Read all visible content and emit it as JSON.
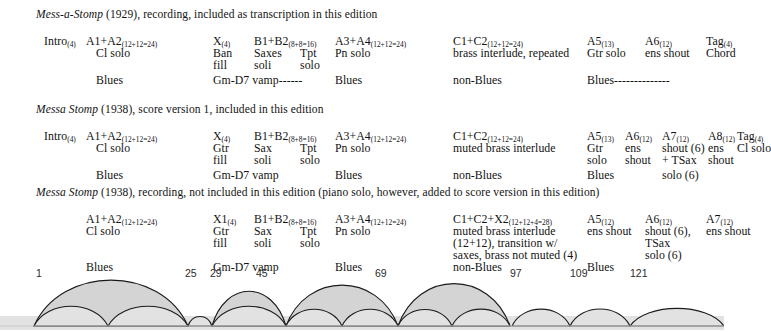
{
  "document": {
    "title": "Mess-a-Stomp / Messa Stomp form chart"
  },
  "blocks": [
    {
      "id": "block-1929-recording",
      "header": {
        "italic": "Mess-a-Stomp",
        "rest": " (1929), recording, included as transcription in this edition"
      },
      "rows": [
        {
          "label": "Intro",
          "sub": "(4)",
          "x": 8,
          "y": 16
        },
        {
          "label": "A1+A2",
          "sub": "(12+12=24)",
          "x": 50,
          "y": 16
        },
        {
          "label": "X",
          "sub": "(4)",
          "x": 177,
          "y": 16
        },
        {
          "label": "B1+B2",
          "sub": "(8+8=16)",
          "x": 218,
          "y": 16
        },
        {
          "label": "A3+A4",
          "sub": "(12+12=24)",
          "x": 299,
          "y": 16
        },
        {
          "label": "C1+C2",
          "sub": "(12+12=24)",
          "x": 417,
          "y": 16
        },
        {
          "label": "A5",
          "sub": "(13)",
          "x": 551,
          "y": 16
        },
        {
          "label": "A6",
          "sub": "(12)",
          "x": 609,
          "y": 16
        },
        {
          "label": "Tag",
          "sub": "(4)",
          "x": 670,
          "y": 16
        },
        {
          "label": "Cl solo",
          "sub": "",
          "x": 60,
          "y": 28
        },
        {
          "label": "Ban",
          "sub": "",
          "x": 177,
          "y": 28
        },
        {
          "label": "Saxes",
          "sub": "",
          "x": 218,
          "y": 28
        },
        {
          "label": "Tpt",
          "sub": "",
          "x": 264,
          "y": 28
        },
        {
          "label": "Pn solo",
          "sub": "",
          "x": 299,
          "y": 28
        },
        {
          "label": "brass interlude, repeated",
          "sub": "",
          "x": 417,
          "y": 28
        },
        {
          "label": "Gtr solo",
          "sub": "",
          "x": 551,
          "y": 28
        },
        {
          "label": "ens shout",
          "sub": "",
          "x": 609,
          "y": 28
        },
        {
          "label": "Chord",
          "sub": "",
          "x": 670,
          "y": 28
        },
        {
          "label": "fill",
          "sub": "",
          "x": 177,
          "y": 40
        },
        {
          "label": "soli",
          "sub": "",
          "x": 218,
          "y": 40
        },
        {
          "label": "solo",
          "sub": "",
          "x": 264,
          "y": 40
        },
        {
          "label": "Blues",
          "sub": "",
          "x": 60,
          "y": 55
        },
        {
          "label": "Gm-D7 vamp------",
          "sub": "",
          "x": 177,
          "y": 55
        },
        {
          "label": "Blues",
          "sub": "",
          "x": 299,
          "y": 55
        },
        {
          "label": "non-Blues",
          "sub": "",
          "x": 417,
          "y": 55
        },
        {
          "label": "Blues--------------",
          "sub": "",
          "x": 551,
          "y": 55
        }
      ]
    },
    {
      "id": "block-1938-score",
      "header": {
        "italic": "Messa Stomp",
        "rest": " (1938), score version 1, included in this edition"
      },
      "rows": [
        {
          "label": "Intro",
          "sub": "(4)",
          "x": 8,
          "y": 16
        },
        {
          "label": "A1+A2",
          "sub": "(12+12=24)",
          "x": 50,
          "y": 16
        },
        {
          "label": "X",
          "sub": "(4)",
          "x": 177,
          "y": 16
        },
        {
          "label": "B1+B2",
          "sub": "(8+8=16)",
          "x": 218,
          "y": 16
        },
        {
          "label": "A3+A4",
          "sub": "(12+12=24)",
          "x": 299,
          "y": 16
        },
        {
          "label": "C1+C2",
          "sub": "(12+12=24)",
          "x": 417,
          "y": 16
        },
        {
          "label": "A5",
          "sub": "(13)",
          "x": 551,
          "y": 16
        },
        {
          "label": "A6",
          "sub": "(12)",
          "x": 589,
          "y": 16
        },
        {
          "label": "A7",
          "sub": "(12)",
          "x": 626,
          "y": 16
        },
        {
          "label": "A8",
          "sub": "(12)",
          "x": 672,
          "y": 16
        },
        {
          "label": "Tag",
          "sub": "(4)",
          "x": 701,
          "y": 16
        },
        {
          "label": "Cl solo",
          "sub": "",
          "x": 60,
          "y": 28
        },
        {
          "label": "Gtr",
          "sub": "",
          "x": 177,
          "y": 28
        },
        {
          "label": "Sax",
          "sub": "",
          "x": 218,
          "y": 28
        },
        {
          "label": "Tpt",
          "sub": "",
          "x": 264,
          "y": 28
        },
        {
          "label": "Pn solo",
          "sub": "",
          "x": 299,
          "y": 28
        },
        {
          "label": "muted brass interlude",
          "sub": "",
          "x": 417,
          "y": 28
        },
        {
          "label": "Gtr",
          "sub": "",
          "x": 551,
          "y": 28
        },
        {
          "label": "ens",
          "sub": "",
          "x": 589,
          "y": 28
        },
        {
          "label": "shout (6)",
          "sub": "",
          "x": 626,
          "y": 28
        },
        {
          "label": "ens",
          "sub": "",
          "x": 672,
          "y": 28
        },
        {
          "label": "Cl solo",
          "sub": "",
          "x": 701,
          "y": 28
        },
        {
          "label": "fill",
          "sub": "",
          "x": 177,
          "y": 40
        },
        {
          "label": "soli",
          "sub": "",
          "x": 218,
          "y": 40
        },
        {
          "label": "solo",
          "sub": "",
          "x": 264,
          "y": 40
        },
        {
          "label": "solo",
          "sub": "",
          "x": 551,
          "y": 40
        },
        {
          "label": "shout",
          "sub": "",
          "x": 589,
          "y": 40
        },
        {
          "label": "+ TSax",
          "sub": "",
          "x": 626,
          "y": 40
        },
        {
          "label": "shout",
          "sub": "",
          "x": 672,
          "y": 40
        },
        {
          "label": "Blues",
          "sub": "",
          "x": 60,
          "y": 55
        },
        {
          "label": "Gm-D7 vamp",
          "sub": "",
          "x": 177,
          "y": 55
        },
        {
          "label": "Blues",
          "sub": "",
          "x": 299,
          "y": 55
        },
        {
          "label": "non-Blues",
          "sub": "",
          "x": 417,
          "y": 55
        },
        {
          "label": "Blues",
          "sub": "",
          "x": 551,
          "y": 55
        },
        {
          "label": "solo (6)",
          "sub": "",
          "x": 626,
          "y": 55
        }
      ]
    },
    {
      "id": "block-1938-recording",
      "header": {
        "italic": "Messa Stomp",
        "rest": " (1938), recording, not included in this edition (piano solo, however, added to score version in this edition)"
      },
      "rows": [
        {
          "label": "A1+A2",
          "sub": "(12+12=24)",
          "x": 50,
          "y": 16
        },
        {
          "label": "X1",
          "sub": "(4)",
          "x": 177,
          "y": 16
        },
        {
          "label": "B1+B2",
          "sub": "(8+8=16)",
          "x": 218,
          "y": 16
        },
        {
          "label": "A3+A4",
          "sub": "(12+12=24)",
          "x": 299,
          "y": 16
        },
        {
          "label": "C1+C2+X2",
          "sub": "(12+12+4=28)",
          "x": 417,
          "y": 16
        },
        {
          "label": "A5",
          "sub": "(12)",
          "x": 551,
          "y": 16
        },
        {
          "label": "A6",
          "sub": "(12)",
          "x": 609,
          "y": 16
        },
        {
          "label": "A7",
          "sub": "(12)",
          "x": 670,
          "y": 16
        },
        {
          "label": "Cl solo",
          "sub": "",
          "x": 50,
          "y": 28
        },
        {
          "label": "Gtr",
          "sub": "",
          "x": 177,
          "y": 28
        },
        {
          "label": "Sax",
          "sub": "",
          "x": 218,
          "y": 28
        },
        {
          "label": "Tpt",
          "sub": "",
          "x": 264,
          "y": 28
        },
        {
          "label": "Pn solo",
          "sub": "",
          "x": 299,
          "y": 28
        },
        {
          "label": "muted brass interlude",
          "sub": "",
          "x": 417,
          "y": 28
        },
        {
          "label": "ens shout",
          "sub": "",
          "x": 551,
          "y": 28
        },
        {
          "label": "shout (6),",
          "sub": "",
          "x": 609,
          "y": 28
        },
        {
          "label": "ens shout",
          "sub": "",
          "x": 670,
          "y": 28
        },
        {
          "label": "fill",
          "sub": "",
          "x": 177,
          "y": 40
        },
        {
          "label": "soli",
          "sub": "",
          "x": 218,
          "y": 40
        },
        {
          "label": "solo",
          "sub": "",
          "x": 264,
          "y": 40
        },
        {
          "label": "(12+12), transition w/",
          "sub": "",
          "x": 417,
          "y": 40
        },
        {
          "label": "TSax",
          "sub": "",
          "x": 609,
          "y": 40
        },
        {
          "label": "saxes, brass not muted (4)",
          "sub": "",
          "x": 417,
          "y": 52
        },
        {
          "label": "solo (6)",
          "sub": "",
          "x": 609,
          "y": 52
        },
        {
          "label": "Blues",
          "sub": "",
          "x": 50,
          "y": 64
        },
        {
          "label": "Gm-D7 vamp",
          "sub": "",
          "x": 177,
          "y": 64
        },
        {
          "label": "Blues",
          "sub": "",
          "x": 299,
          "y": 64
        },
        {
          "label": "non-Blues",
          "sub": "",
          "x": 417,
          "y": 64
        },
        {
          "label": "Blues",
          "sub": "",
          "x": 551,
          "y": 64
        }
      ]
    }
  ],
  "arc_diagram": {
    "measure_labels": [
      {
        "text": "1",
        "x": 36,
        "y": 4
      },
      {
        "text": "25",
        "x": 185,
        "y": 4
      },
      {
        "text": "29",
        "x": 210,
        "y": 4
      },
      {
        "text": "45",
        "x": 256,
        "y": 4
      },
      {
        "text": "69",
        "x": 375,
        "y": 4
      },
      {
        "text": "97",
        "x": 510,
        "y": 4
      },
      {
        "text": "109",
        "x": 570,
        "y": 4
      },
      {
        "text": "121",
        "x": 630,
        "y": 4
      }
    ],
    "baseline_y": 62,
    "fill_color": "#d4d4d4",
    "stroke_color": "#1a1a1a",
    "band_color": "#e2e2e2",
    "upper_arcs": [
      {
        "x0": 34,
        "x1": 188,
        "h": 44
      },
      {
        "x0": 212,
        "x1": 286,
        "h": 38
      },
      {
        "x0": 286,
        "x1": 398,
        "h": 42
      },
      {
        "x0": 398,
        "x1": 510,
        "h": 44
      }
    ],
    "lower_arcs": [
      {
        "x0": 34,
        "x1": 108,
        "h": 18
      },
      {
        "x0": 108,
        "x1": 188,
        "h": 18
      },
      {
        "x0": 188,
        "x1": 212,
        "h": 10
      },
      {
        "x0": 212,
        "x1": 286,
        "h": 18
      },
      {
        "x0": 286,
        "x1": 342,
        "h": 16
      },
      {
        "x0": 342,
        "x1": 398,
        "h": 16
      },
      {
        "x0": 398,
        "x1": 452,
        "h": 16
      },
      {
        "x0": 452,
        "x1": 510,
        "h": 16
      },
      {
        "x0": 512,
        "x1": 570,
        "h": 16
      },
      {
        "x0": 570,
        "x1": 630,
        "h": 16
      },
      {
        "x0": 630,
        "x1": 724,
        "h": 16
      }
    ]
  }
}
